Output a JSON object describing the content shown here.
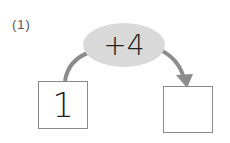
{
  "problem": {
    "label": "(1)",
    "operation": "+4",
    "start_value": "1",
    "answer_value": ""
  },
  "colors": {
    "ellipse_fill": "#d9d9d9",
    "arrow": "#8c8c8c",
    "box_border": "#8a8a8a",
    "text": "#222222"
  }
}
